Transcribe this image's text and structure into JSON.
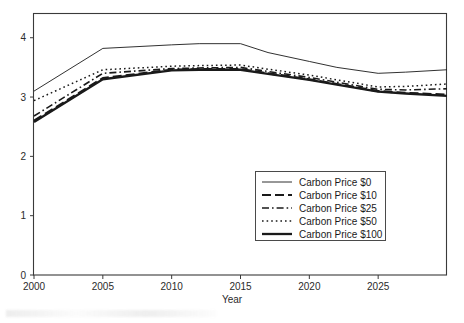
{
  "chart_data": {
    "type": "line",
    "title": "",
    "xlabel": "Year",
    "ylabel": "",
    "xlim": [
      2000,
      2030
    ],
    "ylim": [
      0,
      4.4
    ],
    "grid": false,
    "legend_position": "inside-lower-right",
    "xticks": [
      2000,
      2005,
      2010,
      2015,
      2020,
      2025
    ],
    "xtick_labels": [
      "2000",
      "2005",
      "2010",
      "2015",
      "2020",
      "2025"
    ],
    "yticks": [
      0,
      1,
      2,
      3,
      4
    ],
    "ytick_labels": [
      "0",
      "1",
      "2",
      "3",
      "4"
    ],
    "x": [
      2000,
      2005,
      2010,
      2012,
      2015,
      2017,
      2020,
      2022,
      2025,
      2027,
      2030
    ],
    "series": [
      {
        "name": "Carbon Price $0",
        "style": "solid-thin",
        "values": [
          3.1,
          3.82,
          3.88,
          3.9,
          3.9,
          3.75,
          3.6,
          3.5,
          3.4,
          3.42,
          3.46
        ]
      },
      {
        "name": "Carbon Price $10",
        "style": "long-dash",
        "values": [
          2.6,
          3.32,
          3.46,
          3.47,
          3.47,
          3.4,
          3.3,
          3.22,
          3.1,
          3.07,
          3.04
        ]
      },
      {
        "name": "Carbon Price $25",
        "style": "dash-dot",
        "values": [
          2.68,
          3.4,
          3.48,
          3.49,
          3.5,
          3.43,
          3.33,
          3.25,
          3.13,
          3.12,
          3.14
        ]
      },
      {
        "name": "Carbon Price $50",
        "style": "dotted",
        "values": [
          2.94,
          3.46,
          3.52,
          3.53,
          3.54,
          3.47,
          3.37,
          3.29,
          3.17,
          3.18,
          3.22
        ]
      },
      {
        "name": "Carbon Price $100",
        "style": "solid-thick",
        "values": [
          2.58,
          3.3,
          3.45,
          3.46,
          3.46,
          3.39,
          3.29,
          3.21,
          3.09,
          3.06,
          3.02
        ]
      }
    ]
  },
  "legend": {
    "items": [
      {
        "label": "Carbon Price $0"
      },
      {
        "label": "Carbon Price $10"
      },
      {
        "label": "Carbon Price $25"
      },
      {
        "label": "Carbon Price $50"
      },
      {
        "label": "Carbon Price $100"
      }
    ]
  },
  "colors": {
    "line": "#1a1a1a",
    "frame": "#3a3a3a",
    "text": "#2b2b2b",
    "background": "#ffffff"
  }
}
